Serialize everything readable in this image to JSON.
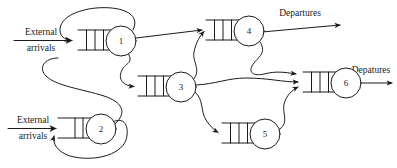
{
  "diagram": {
    "type": "open-queueing-network",
    "title": "",
    "canvas": {
      "width": 397,
      "height": 168
    },
    "colors": {
      "stroke": "#1a1a1a",
      "background": "#ffffff",
      "node_fill": "#ffffff"
    },
    "nodes": [
      {
        "id": "1",
        "label": "1",
        "cx": 121,
        "cy": 41,
        "r": 15,
        "queue": {
          "x": 78,
          "y": 30,
          "width": 34,
          "height": 20,
          "slots": 3
        }
      },
      {
        "id": "2",
        "label": "2",
        "cx": 101,
        "cy": 129,
        "r": 15,
        "queue": {
          "x": 58,
          "y": 118,
          "width": 34,
          "height": 20,
          "slots": 2
        }
      },
      {
        "id": "3",
        "label": "3",
        "cx": 181,
        "cy": 87,
        "r": 15,
        "queue": {
          "x": 138,
          "y": 76,
          "width": 34,
          "height": 20,
          "slots": 3
        }
      },
      {
        "id": "4",
        "label": "4",
        "cx": 249,
        "cy": 31,
        "r": 15,
        "queue": {
          "x": 206,
          "y": 20,
          "width": 34,
          "height": 20,
          "slots": 3
        }
      },
      {
        "id": "5",
        "label": "5",
        "cx": 265,
        "cy": 134,
        "r": 15,
        "queue": {
          "x": 222,
          "y": 123,
          "width": 34,
          "height": 20,
          "slots": 3
        }
      },
      {
        "id": "6",
        "label": "6",
        "cx": 346,
        "cy": 83,
        "r": 15,
        "queue": {
          "x": 303,
          "y": 72,
          "width": 34,
          "height": 20,
          "slots": 3
        }
      }
    ],
    "labels": {
      "external_arrivals_top_line1": "External",
      "external_arrivals_top_line2": "arrivals",
      "external_arrivals_bottom_line1": "External",
      "external_arrivals_bottom_line2": "arrivals",
      "departures_top": "Departures",
      "departures_right": "Depatures"
    },
    "edges": [
      {
        "name": "external-arrival-to-node-1",
        "from": "external",
        "to": "1"
      },
      {
        "name": "external-arrival-to-node-2",
        "from": "external",
        "to": "2"
      },
      {
        "name": "node-1-feedback-to-node-1",
        "from": "1",
        "to": "1"
      },
      {
        "name": "node-1-to-node-3",
        "from": "1",
        "to": "3"
      },
      {
        "name": "node-1-to-node-4",
        "from": "1",
        "to": "4"
      },
      {
        "name": "node-2-feedback-to-node-2",
        "from": "2",
        "to": "2"
      },
      {
        "name": "node-2-to-node-3",
        "from": "2",
        "to": "3"
      },
      {
        "name": "node-3-to-node-4",
        "from": "3",
        "to": "4"
      },
      {
        "name": "node-3-to-node-5",
        "from": "3",
        "to": "5"
      },
      {
        "name": "node-3-to-node-6",
        "from": "3",
        "to": "6"
      },
      {
        "name": "node-4-to-departures",
        "from": "4",
        "to": "departures"
      },
      {
        "name": "node-4-to-node-6",
        "from": "4",
        "to": "6"
      },
      {
        "name": "node-5-to-node-6",
        "from": "5",
        "to": "6"
      },
      {
        "name": "node-6-to-departures",
        "from": "6",
        "to": "departures"
      }
    ]
  }
}
